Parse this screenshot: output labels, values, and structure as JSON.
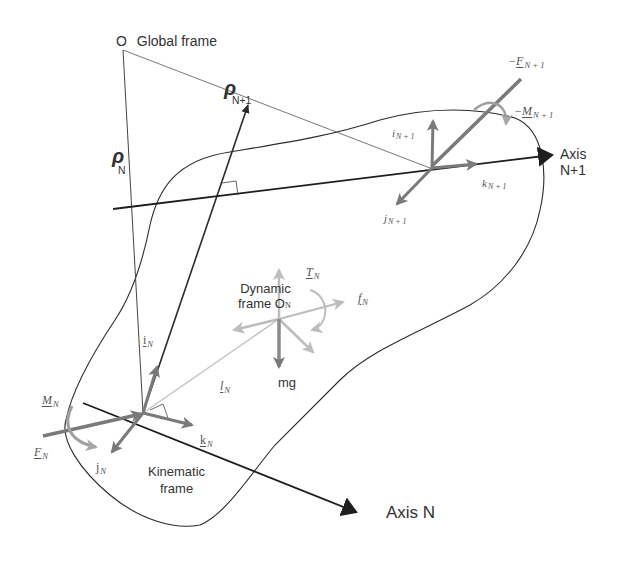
{
  "diagram": {
    "type": "rigid-body kinematics / dynamics free-body diagram",
    "colors": {
      "line_dark": "#2b2b2b",
      "vector_mid": "#7a7a7a",
      "vector_light": "#bdbdbd",
      "text": "#333333",
      "background": "#ffffff"
    },
    "global_frame": {
      "origin_label": "O",
      "title": "Global frame"
    },
    "position_vectors": {
      "rho_n": {
        "symbol": "ρ",
        "subscript": "N"
      },
      "rho_n1": {
        "symbol": "ρ",
        "subscript": "N+1"
      }
    },
    "axes": {
      "axis_n": {
        "label": "Axis N"
      },
      "axis_n1": {
        "line1": "Axis",
        "line2": "N+1"
      }
    },
    "kinematic_frame": {
      "title_line1": "Kinematic",
      "title_line2": "frame",
      "i": {
        "base": "i",
        "sub": "N"
      },
      "j": {
        "base": "j",
        "sub": "N"
      },
      "k": {
        "base": "k",
        "sub": "N"
      },
      "force": {
        "base": "F",
        "sub": "N"
      },
      "moment": {
        "base": "M",
        "sub": "N"
      }
    },
    "dynamic_frame": {
      "title_line1": "Dynamic",
      "title_line2": "frame O",
      "title_sub": "N",
      "torque": {
        "base": "T",
        "sub": "N"
      },
      "force": {
        "base": "f",
        "sub": "N"
      },
      "offset": {
        "base": "l",
        "sub": "N"
      },
      "gravity": "mg"
    },
    "next_joint_frame": {
      "i": {
        "base": "i",
        "sub": "N + 1"
      },
      "j": {
        "base": "j",
        "sub": "N + 1"
      },
      "k": {
        "base": "k",
        "sub": "N + 1"
      },
      "force": {
        "prefix": "−",
        "base": "F",
        "sub": "N + 1"
      },
      "moment": {
        "prefix": "−",
        "base": "M",
        "sub": "N + 1"
      }
    }
  }
}
